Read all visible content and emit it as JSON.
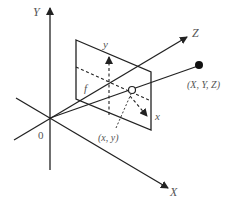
{
  "diagram": {
    "colors": {
      "line": "#222222",
      "label": "#555555",
      "background": "#ffffff"
    },
    "world_axes": [
      {
        "name": "Y",
        "label": "Y"
      },
      {
        "name": "Z",
        "label": "Z"
      },
      {
        "name": "X",
        "label": "X"
      }
    ],
    "origin_label": "0",
    "image_plane": {
      "axes": [
        {
          "name": "y",
          "label": "y"
        },
        {
          "name": "x",
          "label": "x"
        }
      ],
      "focal_length_label": "f",
      "projected_point_label": "(x, y)"
    },
    "world_point_label": "(X, Y, Z)"
  }
}
